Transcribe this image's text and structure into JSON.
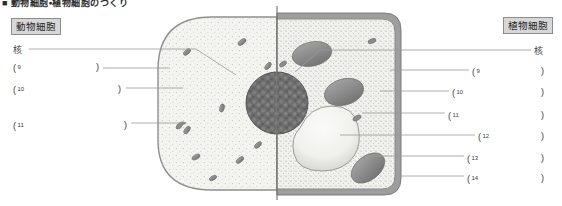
{
  "heading": "■ 動物細胞・植物細胞のつくり",
  "titles": {
    "animal": "動物細胞",
    "plant": "植物細胞"
  },
  "left_labels": [
    {
      "id": "nucleus",
      "text": "核",
      "kind": "word",
      "top": 45
    },
    {
      "id": "blank-9",
      "num": "9",
      "kind": "blank",
      "top": 62,
      "open_x": 13,
      "close_x": 96
    },
    {
      "id": "blank-10",
      "num": "10",
      "kind": "blank",
      "top": 84,
      "open_x": 13,
      "close_x": 118
    },
    {
      "id": "blank-11",
      "num": "11",
      "kind": "blank",
      "top": 120,
      "open_x": 13,
      "close_x": 124
    }
  ],
  "right_labels": [
    {
      "id": "nucleus",
      "text": "核",
      "kind": "word",
      "top": 46
    },
    {
      "id": "blank-9",
      "num": "9",
      "kind": "blank",
      "top": 66,
      "open_x": 472,
      "close_x": 541
    },
    {
      "id": "blank-10",
      "num": "10",
      "kind": "blank",
      "top": 87,
      "open_x": 452,
      "close_x": 541
    },
    {
      "id": "blank-11",
      "num": "11",
      "kind": "blank",
      "top": 110,
      "open_x": 448,
      "close_x": 541
    },
    {
      "id": "blank-12",
      "num": "12",
      "kind": "blank",
      "top": 131,
      "open_x": 478,
      "close_x": 541
    },
    {
      "id": "blank-13",
      "num": "13",
      "kind": "blank",
      "top": 153,
      "open_x": 467,
      "close_x": 541
    },
    {
      "id": "blank-14",
      "num": "14",
      "kind": "blank",
      "top": 173,
      "open_x": 467,
      "close_x": 541
    }
  ],
  "diagram": {
    "divider_x": 277,
    "parts": {
      "nucleus": "核",
      "cytoplasm": "細胞質",
      "cell_membrane": "細胞膜",
      "mitochondrion": "ミトコンドリア",
      "chloroplast": "葉緑体",
      "vacuole": "液胞",
      "cell_wall": "細胞壁"
    }
  },
  "colors": {
    "ink": "#3a3a3a",
    "line": "#8c8c8c",
    "chip_fill": "#d7d7d7",
    "chip_border": "#8d8d8d",
    "cytoplasm": "#f2f2ef",
    "membrane": "#9a9a9a",
    "nucleus": "#6b6b6b",
    "organelle": "#8f8f8f",
    "vacuole": "#ededea",
    "wall": "#9e9e9e"
  }
}
